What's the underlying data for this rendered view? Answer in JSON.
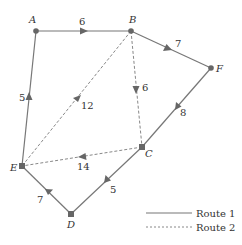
{
  "diagram": {
    "type": "directed-weighted-graph",
    "colors": {
      "edge": "#777777",
      "node": "#666666",
      "text": "#333333"
    },
    "nodes": [
      {
        "id": "A",
        "label": "A",
        "x": 36,
        "y": 31
      },
      {
        "id": "B",
        "label": "B",
        "x": 131,
        "y": 31
      },
      {
        "id": "F",
        "label": "F",
        "x": 211,
        "y": 68
      },
      {
        "id": "C",
        "label": "C",
        "x": 142,
        "y": 147
      },
      {
        "id": "E",
        "label": "E",
        "x": 22,
        "y": 166
      },
      {
        "id": "D",
        "label": "D",
        "x": 71,
        "y": 214
      }
    ],
    "edges": [
      {
        "from": "E",
        "to": "A",
        "weight": "5",
        "route": "Route 1"
      },
      {
        "from": "A",
        "to": "B",
        "weight": "6",
        "route": "Route 1"
      },
      {
        "from": "B",
        "to": "F",
        "weight": "7",
        "route": "Route 1"
      },
      {
        "from": "F",
        "to": "C",
        "weight": "8",
        "route": "Route 1"
      },
      {
        "from": "C",
        "to": "D",
        "weight": "5",
        "route": "Route 1"
      },
      {
        "from": "D",
        "to": "E",
        "weight": "7",
        "route": "Route 1"
      },
      {
        "from": "B",
        "to": "E",
        "weight": "12",
        "route": "Route 2"
      },
      {
        "from": "B",
        "to": "C",
        "weight": "6",
        "route": "Route 2"
      },
      {
        "from": "C",
        "to": "E",
        "weight": "14",
        "route": "Route 2"
      }
    ],
    "legend": [
      {
        "label": "Route 1",
        "style": "solid"
      },
      {
        "label": "Route 2",
        "style": "dashed"
      }
    ]
  }
}
